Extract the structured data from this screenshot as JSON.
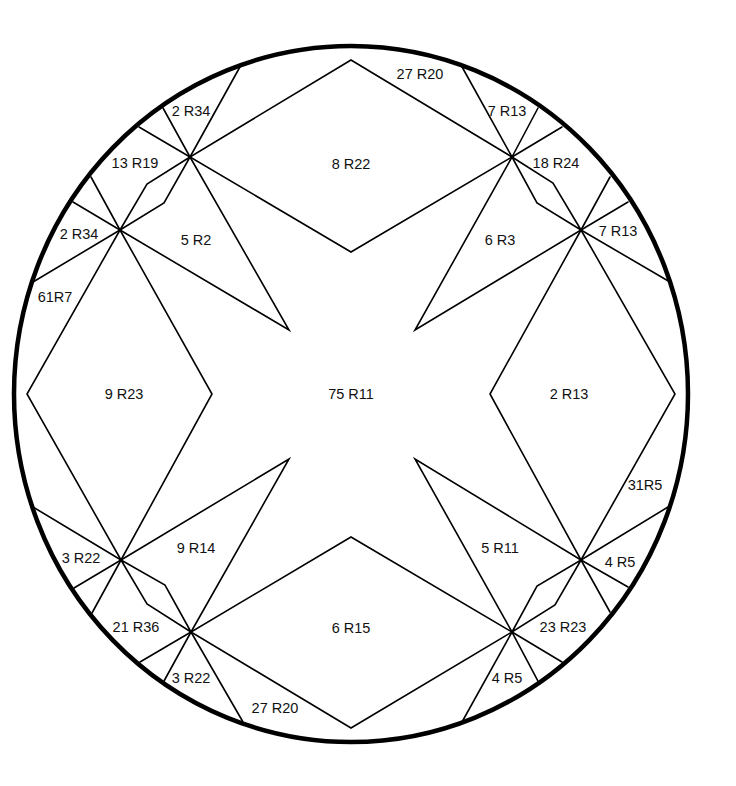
{
  "diagram": {
    "type": "pattern-piece-layout",
    "shape": "circle",
    "colors": {
      "outline": "#000000",
      "background": "#ffffff",
      "text": "#111111"
    },
    "regions": [
      {
        "id": "center",
        "label": "75 R11",
        "x": 351,
        "y": 394
      },
      {
        "id": "top-diamond",
        "label": "8 R22",
        "x": 351,
        "y": 164
      },
      {
        "id": "bottom-diamond",
        "label": "6 R15",
        "x": 351,
        "y": 628
      },
      {
        "id": "left-diamond",
        "label": "9 R23",
        "x": 124,
        "y": 394
      },
      {
        "id": "right-diamond",
        "label": "2 R13",
        "x": 569,
        "y": 394
      },
      {
        "id": "tl-star-arm",
        "label": "5 R2",
        "x": 196,
        "y": 240
      },
      {
        "id": "tr-star-arm",
        "label": "6 R3",
        "x": 500,
        "y": 240
      },
      {
        "id": "bl-star-arm",
        "label": "9 R14",
        "x": 196,
        "y": 548
      },
      {
        "id": "br-star-arm",
        "label": "5 R11",
        "x": 500,
        "y": 548
      },
      {
        "id": "top-right-band",
        "label": "27 R20",
        "x": 420,
        "y": 74
      },
      {
        "id": "bottom-left-band",
        "label": "27 R20",
        "x": 275,
        "y": 708
      },
      {
        "id": "tl-top-wedge",
        "label": "2 R34",
        "x": 191,
        "y": 111
      },
      {
        "id": "tl-mid-wedge",
        "label": "13 R19",
        "x": 135,
        "y": 163
      },
      {
        "id": "tl-left-wedge",
        "label": "2 R34",
        "x": 79,
        "y": 234
      },
      {
        "id": "left-upper-band",
        "label": "61R7",
        "x": 55,
        "y": 297
      },
      {
        "id": "tr-top-wedge",
        "label": "7 R13",
        "x": 507,
        "y": 111
      },
      {
        "id": "tr-mid-wedge",
        "label": "18 R24",
        "x": 556,
        "y": 163
      },
      {
        "id": "tr-right-wedge",
        "label": "7 R13",
        "x": 618,
        "y": 231
      },
      {
        "id": "right-lower-band",
        "label": "31R5",
        "x": 645,
        "y": 485
      },
      {
        "id": "bl-left-wedge",
        "label": "3 R22",
        "x": 81,
        "y": 558
      },
      {
        "id": "bl-mid-wedge",
        "label": "21 R36",
        "x": 136,
        "y": 627
      },
      {
        "id": "bl-bottom-wedge",
        "label": "3 R22",
        "x": 191,
        "y": 678
      },
      {
        "id": "br-right-wedge",
        "label": "4 R5",
        "x": 620,
        "y": 562
      },
      {
        "id": "br-mid-wedge",
        "label": "23 R23",
        "x": 563,
        "y": 627
      },
      {
        "id": "br-bottom-wedge",
        "label": "4 R5",
        "x": 507,
        "y": 678
      }
    ]
  }
}
